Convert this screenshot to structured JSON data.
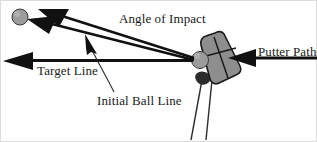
{
  "figure": {
    "background_color": "#ffffff",
    "ink_color": "#111111",
    "ball_fill_color": "#9a9a9a",
    "putter_fill_color": "#8e8e8e",
    "border_color": "#d8d8d8",
    "width": 317,
    "height": 142
  },
  "labels": {
    "angle_of_impact": "Angle of Impact",
    "target_line": "Target Line",
    "initial_ball_line": "Initial Ball Line",
    "putter_path": "Putter Path"
  },
  "elements": {
    "ball_left": {
      "name": "golf-ball-left",
      "cx": 20,
      "cy": 17,
      "r": 8
    },
    "ball_right": {
      "name": "golf-ball-at-impact",
      "cx": 200,
      "cy": 60,
      "r": 9
    },
    "putter_head": {
      "name": "putter-head",
      "tilt_degrees": 20
    },
    "putter_shaft": {
      "name": "putter-shaft"
    },
    "arrows": [
      {
        "name": "target-line-arrow",
        "from_x": 200,
        "from_y": 60,
        "to_x": 4,
        "to_y": 60,
        "direction": "left"
      },
      {
        "name": "initial-ball-line-arrow",
        "from_x": 200,
        "from_y": 60,
        "to_x": 42,
        "to_y": 22,
        "direction": "up-left"
      },
      {
        "name": "angle-of-impact-arrow",
        "from_x": 200,
        "from_y": 60,
        "to_x": 56,
        "to_y": 14,
        "direction": "up-left"
      },
      {
        "name": "putter-path-arrow",
        "from_x": 317,
        "from_y": 58,
        "to_x": 228,
        "to_y": 58,
        "direction": "left"
      }
    ],
    "leaders": [
      {
        "name": "initial-ball-line-leader",
        "from_x": 113,
        "from_y": 92,
        "to_x": 90,
        "to_y": 46
      },
      {
        "name": "initial-ball-line-pointer",
        "name_alt": "pointer-arrowhead",
        "tip_x": 86,
        "tip_y": 36
      }
    ]
  }
}
